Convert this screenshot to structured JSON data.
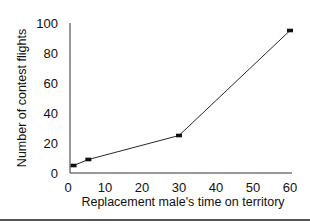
{
  "chart_data": {
    "type": "line",
    "title": "",
    "xlabel": "Replacement male's time on territory",
    "ylabel": "Number of contest flights",
    "x": [
      1.5,
      5.5,
      30,
      60
    ],
    "series": [
      {
        "name": "Contest flights",
        "values": [
          5,
          9,
          25,
          95
        ],
        "marker": "square",
        "color": "#111111"
      }
    ],
    "xlim": [
      0,
      60
    ],
    "ylim": [
      0,
      100
    ],
    "xticks": [
      0,
      10,
      20,
      30,
      40,
      50,
      60
    ],
    "yticks": [
      0,
      20,
      40,
      60,
      80,
      100
    ],
    "grid": false,
    "legend": null
  }
}
